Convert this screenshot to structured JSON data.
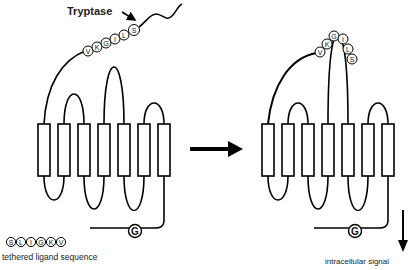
{
  "figure": {
    "enzyme_label": "Tryptase",
    "legend": {
      "sequence": [
        "S",
        "L",
        "I",
        "G",
        "K",
        "V"
      ],
      "caption": "tethered ligand sequence"
    },
    "left_receptor": {
      "state": "inactive",
      "ligand_beads": [
        "V",
        "K",
        "G",
        "I",
        "L",
        "S"
      ],
      "g_protein_label": "G",
      "transmembrane_segments": 7
    },
    "right_receptor": {
      "state": "activated",
      "ligand_beads": [
        "V",
        "K",
        "G",
        "I",
        "L",
        "S"
      ],
      "g_protein_label": "G",
      "transmembrane_segments": 7
    },
    "output_label": "intracellular signal",
    "colors": {
      "stroke": "#000000",
      "background": "#ffffff"
    }
  }
}
